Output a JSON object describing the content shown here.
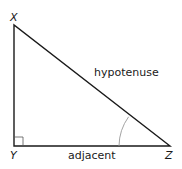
{
  "diagram": {
    "type": "right-triangle",
    "vertices": [
      {
        "name": "X",
        "label": "X",
        "x": 14,
        "y": 25
      },
      {
        "name": "Y",
        "label": "Y",
        "x": 14,
        "y": 146
      },
      {
        "name": "Z",
        "label": "Z",
        "x": 170,
        "y": 146
      }
    ],
    "right_angle_at": "Y",
    "marked_angle_at": "Z",
    "sides": {
      "hypotenuse": {
        "label": "hypotenuse",
        "from": "X",
        "to": "Z"
      },
      "adjacent": {
        "label": "adjacent",
        "from": "Y",
        "to": "Z"
      },
      "opposite": {
        "label": "",
        "from": "X",
        "to": "Y"
      }
    },
    "colors": {
      "line": "#1a1a1a",
      "arc": "#999999",
      "background": "#ffffff"
    }
  }
}
